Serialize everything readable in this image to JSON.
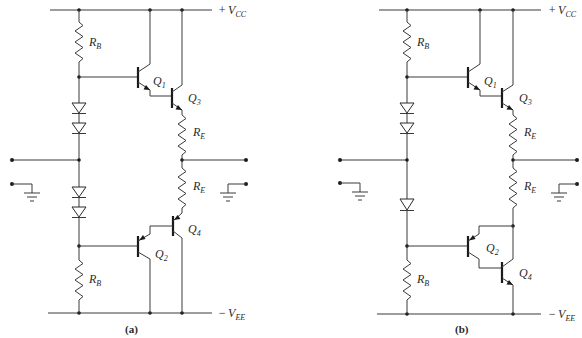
{
  "figure": {
    "panels": [
      {
        "caption": "(a)",
        "supply_top": {
          "sign": "+",
          "main": "V",
          "sub": "CC"
        },
        "supply_bottom": {
          "sign": "−",
          "main": "V",
          "sub": "EE"
        },
        "labels": {
          "rb_top": {
            "main": "R",
            "sub": "B"
          },
          "rb_bottom": {
            "main": "R",
            "sub": "B"
          },
          "re_top": {
            "main": "R",
            "sub": "E"
          },
          "re_bottom": {
            "main": "R",
            "sub": "E"
          },
          "q1": {
            "main": "Q",
            "sub": "1"
          },
          "q2": {
            "main": "Q",
            "sub": "2"
          },
          "q3": {
            "main": "Q",
            "sub": "3"
          },
          "q4": {
            "main": "Q",
            "sub": "4"
          }
        },
        "diodes_upper": 2,
        "diodes_lower": 2,
        "output_stage": "complementary darlington"
      },
      {
        "caption": "(b)",
        "supply_top": {
          "sign": "+",
          "main": "V",
          "sub": "CC"
        },
        "supply_bottom": {
          "sign": "−",
          "main": "V",
          "sub": "EE"
        },
        "labels": {
          "rb_top": {
            "main": "R",
            "sub": "B"
          },
          "rb_bottom": {
            "main": "R",
            "sub": "B"
          },
          "re_top": {
            "main": "R",
            "sub": "E"
          },
          "re_bottom": {
            "main": "R",
            "sub": "E"
          },
          "q1": {
            "main": "Q",
            "sub": "1"
          },
          "q2": {
            "main": "Q",
            "sub": "2"
          },
          "q3": {
            "main": "Q",
            "sub": "3"
          },
          "q4": {
            "main": "Q",
            "sub": "4"
          }
        },
        "diodes_upper": 2,
        "diodes_lower": 1,
        "output_stage": "quasi-complementary (PNP-NPN pair)"
      }
    ],
    "icons": [
      "resistor-icon",
      "diode-icon",
      "npn-transistor-icon",
      "pnp-transistor-icon",
      "ground-icon",
      "terminal-node-icon"
    ]
  }
}
